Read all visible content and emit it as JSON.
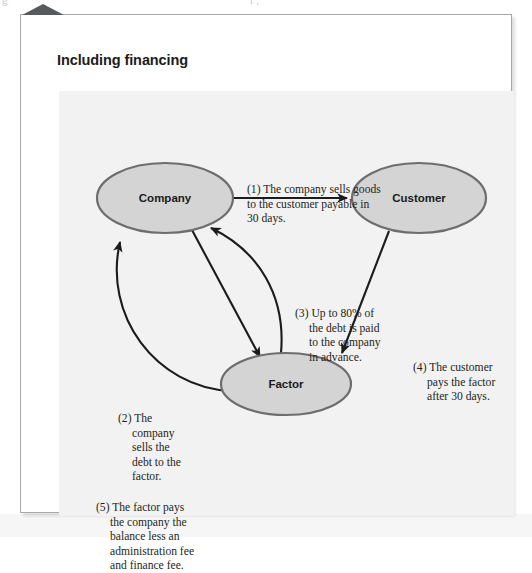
{
  "page": {
    "top_artifact_left": "g",
    "top_artifact_right": "l   ,"
  },
  "figure": {
    "title": "Including financing",
    "corner_tab_icon": "triangle-up-icon"
  },
  "diagram": {
    "type": "cycle-flow",
    "nodes": [
      {
        "id": "company",
        "label": "Company",
        "cx": 106,
        "cy": 107,
        "rx": 68,
        "ry": 35
      },
      {
        "id": "customer",
        "label": "Customer",
        "cx": 360,
        "cy": 107,
        "rx": 67,
        "ry": 35
      },
      {
        "id": "factor",
        "label": "Factor",
        "cx": 227,
        "cy": 293,
        "rx": 65,
        "ry": 31
      }
    ],
    "edges": [
      {
        "id": "company-to-customer",
        "from": "company",
        "to": "customer",
        "note": "1"
      },
      {
        "id": "company-to-factor",
        "from": "company",
        "to": "factor",
        "note": "2"
      },
      {
        "id": "factor-to-company-advance",
        "from": "factor",
        "to": "company",
        "note": "3"
      },
      {
        "id": "customer-to-factor",
        "from": "customer",
        "to": "factor",
        "note": "4"
      },
      {
        "id": "factor-to-company-balance",
        "from": "factor",
        "to": "company",
        "note": "5"
      }
    ],
    "node_fill": "#d4d4d4",
    "node_stroke": "#6d6d6d",
    "arrow_color": "#1b1b1b",
    "panel_bg": "#f2f2f2"
  },
  "annotations": {
    "n1": {
      "marker": "(1) ",
      "line1": "The company sells goods",
      "line2": "to the customer payable in",
      "line3": "30 days."
    },
    "n2": {
      "marker": "(2) ",
      "line1": "The",
      "line2": "company",
      "line3": "sells the",
      "line4": "debt to the",
      "line5": "factor."
    },
    "n3": {
      "marker": "(3) ",
      "line1": "Up to 80% of",
      "line2": "the debt is paid",
      "line3": "to the company",
      "line4": "in advance."
    },
    "n4": {
      "marker": "(4) ",
      "line1": "The customer",
      "line2": "pays the factor",
      "line3": "after 30 days."
    },
    "n5": {
      "marker": "(5) ",
      "line1": "The factor pays",
      "line2": "the company the",
      "line3": "balance less an",
      "line4": "administration fee",
      "line5": "and finance fee."
    }
  }
}
